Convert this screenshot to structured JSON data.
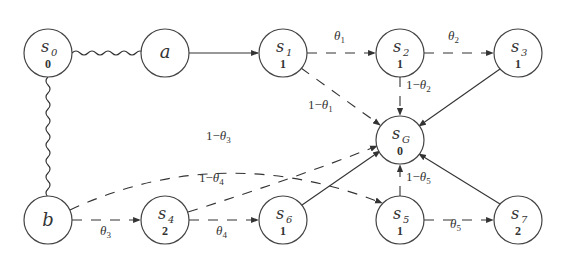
{
  "diagram": {
    "nodes": [
      {
        "id": "s0",
        "name": "s",
        "sub": "0",
        "value": "0",
        "x": 48,
        "y": 53
      },
      {
        "id": "a",
        "name": "a",
        "sub": "",
        "value": "",
        "x": 165,
        "y": 53
      },
      {
        "id": "s1",
        "name": "s",
        "sub": "1",
        "value": "1",
        "x": 283,
        "y": 53
      },
      {
        "id": "s2",
        "name": "s",
        "sub": "2",
        "value": "1",
        "x": 400,
        "y": 53
      },
      {
        "id": "s3",
        "name": "s",
        "sub": "3",
        "value": "1",
        "x": 518,
        "y": 53
      },
      {
        "id": "sG",
        "name": "s",
        "sub": "G",
        "value": "0",
        "x": 400,
        "y": 140
      },
      {
        "id": "b",
        "name": "b",
        "sub": "",
        "value": "",
        "x": 48,
        "y": 220
      },
      {
        "id": "s4",
        "name": "s",
        "sub": "4",
        "value": "2",
        "x": 165,
        "y": 220
      },
      {
        "id": "s6",
        "name": "s",
        "sub": "6",
        "value": "1",
        "x": 283,
        "y": 220
      },
      {
        "id": "s5",
        "name": "s",
        "sub": "5",
        "value": "1",
        "x": 400,
        "y": 220
      },
      {
        "id": "s7",
        "name": "s",
        "sub": "7",
        "value": "2",
        "x": 518,
        "y": 220
      }
    ],
    "edges": [
      {
        "from": "s0",
        "to": "a",
        "style": "wavy",
        "label": ""
      },
      {
        "from": "s0",
        "to": "b",
        "style": "wavy",
        "label": ""
      },
      {
        "from": "a",
        "to": "s1",
        "style": "solid",
        "label": ""
      },
      {
        "from": "s1",
        "to": "s2",
        "style": "dashed",
        "label": "θ1"
      },
      {
        "from": "s2",
        "to": "s3",
        "style": "dashed",
        "label": "θ2"
      },
      {
        "from": "s1",
        "to": "sG",
        "style": "dashed",
        "label": "1−θ1"
      },
      {
        "from": "s2",
        "to": "sG",
        "style": "dashed",
        "label": "1−θ2"
      },
      {
        "from": "s3",
        "to": "sG",
        "style": "solid",
        "label": ""
      },
      {
        "from": "b",
        "to": "s4",
        "style": "dashed",
        "label": "θ3"
      },
      {
        "from": "b",
        "to": "s5",
        "style": "dashed",
        "label": "1−θ3"
      },
      {
        "from": "s4",
        "to": "s6",
        "style": "dashed",
        "label": "θ4"
      },
      {
        "from": "s4",
        "to": "sG",
        "style": "dashed",
        "label": "1−θ4"
      },
      {
        "from": "s6",
        "to": "sG",
        "style": "solid",
        "label": ""
      },
      {
        "from": "s5",
        "to": "s7",
        "style": "dashed",
        "label": "θ5"
      },
      {
        "from": "s5",
        "to": "sG",
        "style": "dashed",
        "label": "1−θ5"
      },
      {
        "from": "s7",
        "to": "sG",
        "style": "solid",
        "label": ""
      }
    ],
    "labels": {
      "theta1": {
        "base": "θ",
        "sub": "1",
        "prefix": ""
      },
      "theta2": {
        "base": "θ",
        "sub": "2",
        "prefix": ""
      },
      "one_minus_theta1": {
        "base": "θ",
        "sub": "1",
        "prefix": "1−"
      },
      "one_minus_theta2": {
        "base": "θ",
        "sub": "2",
        "prefix": "1−"
      },
      "theta3": {
        "base": "θ",
        "sub": "3",
        "prefix": ""
      },
      "one_minus_theta3": {
        "base": "θ",
        "sub": "3",
        "prefix": "1−"
      },
      "theta4": {
        "base": "θ",
        "sub": "4",
        "prefix": ""
      },
      "one_minus_theta4": {
        "base": "θ",
        "sub": "4",
        "prefix": "1−"
      },
      "theta5": {
        "base": "θ",
        "sub": "5",
        "prefix": ""
      },
      "one_minus_theta5": {
        "base": "θ",
        "sub": "5",
        "prefix": "1−"
      }
    }
  }
}
